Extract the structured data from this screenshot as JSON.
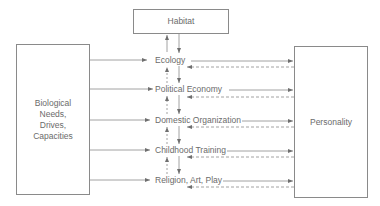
{
  "diagram": {
    "top_box": {
      "label": "Habitat"
    },
    "left_box": {
      "label_lines": [
        "Biological",
        "Needs,",
        "Drives,",
        "Capacities"
      ]
    },
    "right_box": {
      "label": "Personality"
    },
    "center_nodes": [
      {
        "label": "Ecology"
      },
      {
        "label": "Political Economy"
      },
      {
        "label": "Domestic Organization"
      },
      {
        "label": "Childhood Training"
      },
      {
        "label": "Religion, Art, Play"
      }
    ],
    "edges": [
      {
        "from": "Habitat",
        "to": "Ecology",
        "style": "solid"
      },
      {
        "from": "Ecology",
        "to": "Habitat",
        "style": "solid"
      },
      {
        "from": "Biological Needs, Drives, Capacities",
        "to": "each center node",
        "style": "solid"
      },
      {
        "from": "each center node",
        "to": "Personality",
        "style": "solid"
      },
      {
        "from": "Personality",
        "to": "each center node",
        "style": "dashed"
      },
      {
        "from": "upper center node",
        "to": "lower center node",
        "style": "solid"
      },
      {
        "from": "lower center node",
        "to": "upper center node",
        "style": "dashed"
      }
    ],
    "colors": {
      "line": "#7a7a7a",
      "text": "#6b6b6b"
    }
  }
}
